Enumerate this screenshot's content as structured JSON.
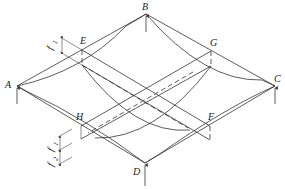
{
  "figure": {
    "points": {
      "A": "A",
      "B": "B",
      "C": "C",
      "D": "D",
      "E": "E",
      "F": "F",
      "G": "G",
      "H": "H"
    },
    "dimensions": {
      "top_left_sag": "f",
      "top_left_sag_sub": "1",
      "bottom_upper_sag": "f",
      "bottom_upper_sag_sub": "1",
      "bottom_lower_sag": "f",
      "bottom_lower_sag_sub": "2"
    },
    "colors": {
      "line": "#333333",
      "background": "#ffffff"
    }
  }
}
